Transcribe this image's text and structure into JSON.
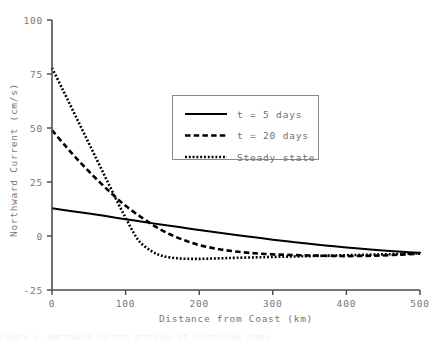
{
  "chart_data": {
    "type": "line",
    "title": "",
    "xlabel": "Distance from Coast (km)",
    "ylabel": "Northward Current (cm/s)",
    "xlim": [
      0,
      500
    ],
    "ylim": [
      -25,
      100
    ],
    "xticks": [
      0,
      100,
      200,
      300,
      400,
      500
    ],
    "yticks": [
      -25,
      0,
      25,
      50,
      75,
      100
    ],
    "xtick_labels": [
      "0",
      "100",
      "200",
      "300",
      "400",
      "500"
    ],
    "ytick_labels": [
      "-25",
      "0",
      "25",
      "50",
      "75",
      "100"
    ],
    "grid": false,
    "legend_position": "upper center",
    "series": [
      {
        "name": "t = 5 days",
        "style": "solid",
        "color": "#000000",
        "x": [
          0,
          25,
          50,
          75,
          100,
          125,
          150,
          175,
          200,
          225,
          250,
          275,
          300,
          325,
          350,
          375,
          400,
          425,
          450,
          475,
          500
        ],
        "y": [
          12.8,
          11.6,
          10.4,
          9.1,
          7.8,
          6.5,
          5.2,
          4.0,
          2.8,
          1.6,
          0.5,
          -0.6,
          -1.7,
          -2.7,
          -3.6,
          -4.5,
          -5.3,
          -6.0,
          -6.7,
          -7.3,
          -7.8
        ]
      },
      {
        "name": "t = 20 days",
        "style": "dashed",
        "color": "#000000",
        "x": [
          0,
          20,
          40,
          60,
          80,
          100,
          120,
          140,
          160,
          180,
          200,
          225,
          250,
          275,
          300,
          325,
          350,
          375,
          400,
          425,
          450,
          475,
          500
        ],
        "y": [
          49.0,
          41.0,
          33.5,
          26.5,
          20.0,
          14.0,
          9.0,
          4.5,
          0.8,
          -2.0,
          -4.2,
          -6.0,
          -7.2,
          -8.0,
          -8.5,
          -8.8,
          -9.0,
          -9.2,
          -9.3,
          -9.2,
          -9.0,
          -8.6,
          -8.2
        ]
      },
      {
        "name": "Steady state",
        "style": "dotted",
        "color": "#000000",
        "x": [
          0,
          15,
          30,
          45,
          60,
          75,
          90,
          100,
          110,
          120,
          135,
          150,
          170,
          190,
          210,
          230,
          250,
          275,
          300,
          325,
          350,
          375,
          400,
          425,
          450,
          475,
          500
        ],
        "y": [
          77.8,
          67.5,
          57.0,
          46.5,
          36.0,
          25.5,
          15.0,
          8.5,
          2.0,
          -3.0,
          -7.0,
          -9.2,
          -10.3,
          -10.6,
          -10.5,
          -10.3,
          -10.1,
          -9.9,
          -9.7,
          -9.5,
          -9.3,
          -9.1,
          -8.9,
          -8.7,
          -8.5,
          -8.3,
          -8.0
        ]
      }
    ]
  },
  "legend": {
    "items": [
      {
        "label": "t = 5 days",
        "style": "solid"
      },
      {
        "label": "t = 20 days",
        "style": "dashed"
      },
      {
        "label": "Steady state",
        "style": "dotted"
      }
    ]
  },
  "caption": {
    "clipped_text": "Figure 3. Northward current profiles at successive times"
  }
}
